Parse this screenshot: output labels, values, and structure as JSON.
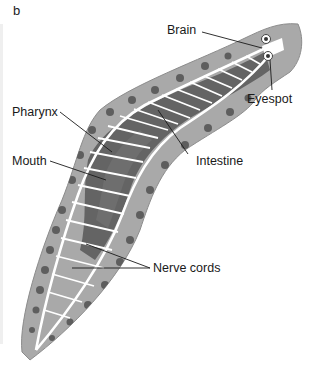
{
  "figure": {
    "panel_letter": "b",
    "colors": {
      "body_fill": "#a9a9a9",
      "body_edge": "#8c8c8c",
      "intestine": "#5c5c5c",
      "nerve": "#ffffff",
      "head_fill": "#b3b3b3",
      "leader_line": "#1a1a1a"
    }
  },
  "labels": {
    "brain": "Brain",
    "eyespot": "Eyespot",
    "pharynx": "Pharynx",
    "intestine": "Intestine",
    "mouth": "Mouth",
    "nerve_cords": "Nerve cords"
  }
}
